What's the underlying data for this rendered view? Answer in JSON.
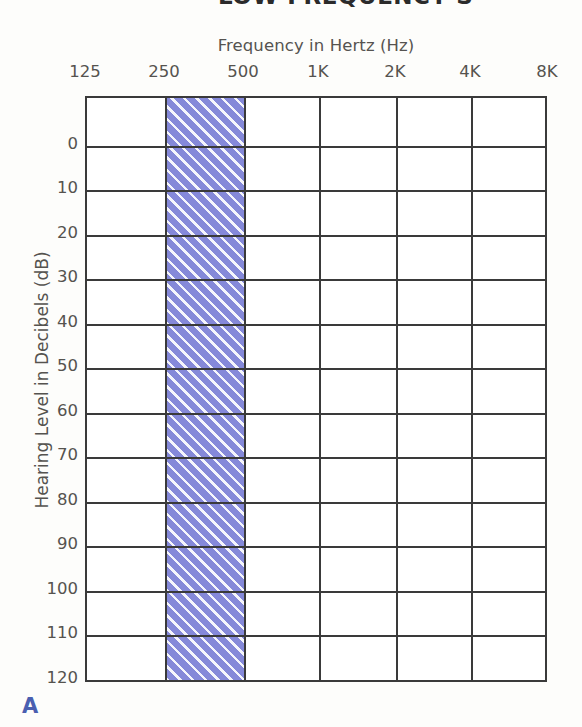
{
  "document": {
    "background_color": "#fdfdfb",
    "cropped_title": "LOW-FREQUENCY S",
    "figure_letter": "A"
  },
  "chart_data": {
    "type": "table",
    "chart_kind": "audiogram-grid",
    "title": "Frequency in Hertz (Hz)",
    "xlabel": "Frequency in Hertz (Hz)",
    "ylabel": "Hearing Level in Decibels (dB)",
    "x_categories": [
      "125",
      "250",
      "500",
      "1K",
      "2K",
      "4K",
      "8K"
    ],
    "x_positions_px": [
      85,
      164,
      243,
      318,
      395,
      470,
      547
    ],
    "y_tick_labels": [
      "0",
      "10",
      "20",
      "30",
      "40",
      "50",
      "60",
      "70",
      "80",
      "90",
      "100",
      "110",
      "120"
    ],
    "y_tick_values": [
      0,
      10,
      20,
      30,
      40,
      50,
      60,
      70,
      80,
      90,
      100,
      110,
      120
    ],
    "ylim": [
      -10,
      120
    ],
    "y_axis_inverted": true,
    "grid": true,
    "legend": "none",
    "series": [],
    "annotations": [
      {
        "name": "low-frequency-shaded-band",
        "kind": "shaded-region",
        "x_from": "250",
        "x_to": "500",
        "y_from": -10,
        "y_to": 120,
        "fill_color": "#7b80d6",
        "hatch": "diagonal-white-stripes",
        "description": "Hatched vertical band spanning the 250 Hz to 500 Hz octave over the full hearing-level range"
      }
    ]
  },
  "axes": {
    "x_title": "Frequency in Hertz (Hz)",
    "y_title": "Hearing Level in Decibels (dB)",
    "x_ticks": [
      {
        "label": "125",
        "x": 85
      },
      {
        "label": "250",
        "x": 164
      },
      {
        "label": "500",
        "x": 243
      },
      {
        "label": "1K",
        "x": 318
      },
      {
        "label": "2K",
        "x": 395
      },
      {
        "label": "4K",
        "x": 470
      },
      {
        "label": "8K",
        "x": 547
      }
    ],
    "y_ticks": [
      {
        "label": "0",
        "y": 49
      },
      {
        "label": "10",
        "y": 93
      },
      {
        "label": "20",
        "y": 138
      },
      {
        "label": "30",
        "y": 182
      },
      {
        "label": "40",
        "y": 227
      },
      {
        "label": "50",
        "y": 271
      },
      {
        "label": "60",
        "y": 316
      },
      {
        "label": "70",
        "y": 360
      },
      {
        "label": "80",
        "y": 405
      },
      {
        "label": "90",
        "y": 449
      },
      {
        "label": "100",
        "y": 494
      },
      {
        "label": "110",
        "y": 538
      },
      {
        "label": "120",
        "y": 583
      }
    ]
  },
  "colors": {
    "band_fill": "#7b80d6",
    "grid_line": "#3a3a3a",
    "text": "#55534f",
    "figure_letter": "#4a5fb0",
    "plot_background": "#ffffff"
  }
}
